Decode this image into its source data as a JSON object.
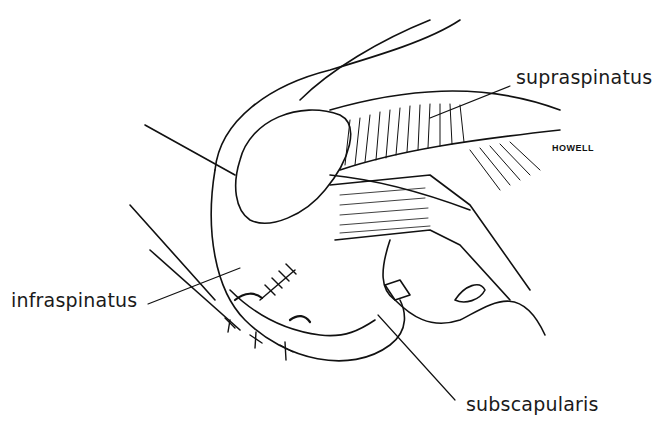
{
  "figure": {
    "labels": {
      "supraspinatus": "supraspinatus",
      "infraspinatus": "infraspinatus",
      "subscapularis": "subscapularis"
    },
    "signature": "HOWELL"
  }
}
